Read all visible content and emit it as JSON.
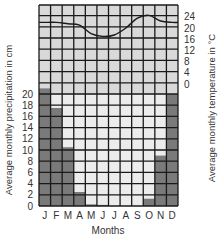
{
  "chart_data": {
    "type": "climograph",
    "title": "",
    "categories": [
      "J",
      "F",
      "M",
      "A",
      "M",
      "J",
      "J",
      "A",
      "S",
      "O",
      "N",
      "D"
    ],
    "series": [
      {
        "name": "Average monthly precipitation",
        "type": "bar",
        "unit": "cm",
        "axis": "left",
        "values": [
          21,
          17.5,
          10.5,
          2.5,
          0.3,
          0.2,
          0,
          0,
          0,
          1.3,
          9,
          20
        ]
      },
      {
        "name": "Average monthly temperature",
        "type": "line",
        "unit": "°C",
        "axis": "right",
        "values": [
          22,
          22,
          21.5,
          21,
          18,
          17,
          17.5,
          20,
          23.5,
          24.5,
          22.5,
          22
        ]
      }
    ],
    "xlabel": "Months",
    "ylabel": "Average monthly precipitation in cm",
    "y2label": "Average monthly temperature in °C",
    "ylim": [
      0,
      20
    ],
    "yticks": [
      0,
      2,
      4,
      6,
      8,
      10,
      12,
      14,
      16,
      18,
      20
    ],
    "y2lim": [
      0,
      24
    ],
    "y2ticks": [
      0,
      4,
      8,
      12,
      16,
      20,
      24
    ],
    "grid": true,
    "colors": {
      "grid_bg": "#d9d9d9",
      "grid_line": "#1a1a1a",
      "bar": "#7a7a7a",
      "empty_cell": "#ececec",
      "line": "#1a1a1a"
    }
  }
}
